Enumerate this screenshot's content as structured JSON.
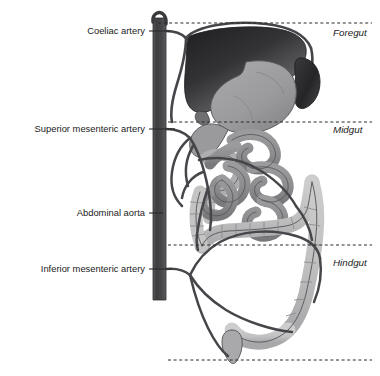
{
  "figure": {
    "background_color": "#ffffff",
    "width": 380,
    "height": 376
  },
  "labels_left": [
    {
      "id": "coeliac-artery",
      "text": "Coeliac artery",
      "text_x": 145,
      "text_y": 31,
      "leader_x1": 149,
      "leader_x2": 170,
      "leader_y": 31
    },
    {
      "id": "superior-mesenteric-artery",
      "text": "Superior mesenteric artery",
      "text_x": 145,
      "text_y": 129,
      "leader_x1": 149,
      "leader_x2": 175,
      "leader_y": 129
    },
    {
      "id": "abdominal-aorta",
      "text": "Abdominal aorta",
      "text_x": 145,
      "text_y": 213,
      "leader_x1": 149,
      "leader_x2": 163,
      "leader_y": 213
    },
    {
      "id": "inferior-mesenteric-artery",
      "text": "Inferior mesenteric artery",
      "text_x": 145,
      "text_y": 269,
      "leader_x1": 149,
      "leader_x2": 172,
      "leader_y": 269
    }
  ],
  "labels_right": [
    {
      "id": "foregut",
      "text": "Foregut",
      "text_x": 333,
      "text_y": 33
    },
    {
      "id": "midgut",
      "text": "Midgut",
      "text_x": 333,
      "text_y": 130
    },
    {
      "id": "hindgut",
      "text": "Hindgut",
      "text_x": 333,
      "text_y": 263
    }
  ],
  "division_lines": [
    {
      "id": "foregut-midgut-upper-boundary",
      "y": 23,
      "x1": 158,
      "x2": 372
    },
    {
      "id": "midgut-boundary",
      "y": 122,
      "x1": 168,
      "x2": 372
    },
    {
      "id": "hindgut-boundary",
      "y": 245,
      "x1": 168,
      "x2": 372
    },
    {
      "id": "hindgut-lower-boundary",
      "y": 360,
      "x1": 168,
      "x2": 372
    }
  ],
  "colors": {
    "aorta": "#4a4a4c",
    "aorta_dark": "#37373a",
    "artery_line": "#46464a",
    "liver_dark": "#2e2e30",
    "liver_light": "#777779",
    "spleen": "#303032",
    "stomach": "#9d9d9f",
    "stomach_shadow": "#87878a",
    "duodenum": "#b5b5b6",
    "small_bowel": "#8f8f91",
    "colon": "#c3c3c4",
    "colon_shade": "#aeaeb0",
    "outline": "#4f4f53",
    "dash_line": "#2a2a2a",
    "label_text": "#1b1b1b",
    "leader": "#2a2a2a"
  },
  "organs": [
    {
      "id": "liver",
      "name": "liver",
      "region": "foregut"
    },
    {
      "id": "stomach",
      "name": "stomach",
      "region": "foregut"
    },
    {
      "id": "spleen",
      "name": "spleen",
      "region": "foregut"
    },
    {
      "id": "duodenum",
      "name": "duodenum",
      "region": "foregut-midgut"
    },
    {
      "id": "jejunum-ileum",
      "name": "jejunum and ileum coils",
      "region": "midgut"
    },
    {
      "id": "ascending-colon",
      "name": "ascending colon",
      "region": "midgut"
    },
    {
      "id": "transverse-colon",
      "name": "transverse colon",
      "region": "midgut-hindgut"
    },
    {
      "id": "descending-colon",
      "name": "descending colon",
      "region": "hindgut"
    },
    {
      "id": "sigmoid-colon",
      "name": "sigmoid colon",
      "region": "hindgut"
    },
    {
      "id": "rectum",
      "name": "rectum",
      "region": "hindgut"
    }
  ]
}
